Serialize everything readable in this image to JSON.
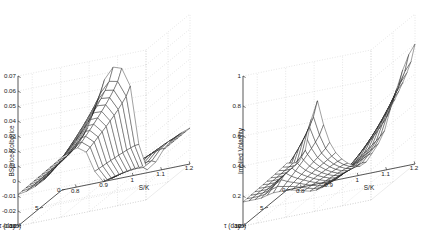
{
  "figure": {
    "background_color": "#ffffff",
    "mesh_color": "#111111",
    "grid_color": "#b9b9b9",
    "axis_color": "#3a3a3a",
    "panel_count": 2
  },
  "chart_data": [
    {
      "type": "surface",
      "panel": "left",
      "title": "",
      "zlabel": "BSprice-Kolbprice",
      "xlabel": "S/K",
      "ylabel": "τ (days)",
      "xticks": [
        "0.8",
        "0.9",
        "1",
        "1.1",
        "1.2"
      ],
      "xtickvals": [
        0.8,
        0.9,
        1,
        1.1,
        1.2
      ],
      "yticks": [
        "0",
        "5",
        "10"
      ],
      "ytickvals": [
        0,
        5,
        10
      ],
      "zticks": [
        "-0.03",
        "-0.02",
        "-0.01",
        "0",
        "0.01",
        "0.02",
        "0.03",
        "0.04",
        "0.05",
        "0.06",
        "0.07"
      ],
      "ztickvals": [
        -0.03,
        -0.02,
        -0.01,
        0,
        0.01,
        0.02,
        0.03,
        0.04,
        0.05,
        0.06,
        0.07
      ],
      "xlim": [
        0.75,
        1.2
      ],
      "ylim": [
        0,
        10
      ],
      "zlim": [
        -0.03,
        0.07
      ],
      "grid": true,
      "mesh_nx": 16,
      "mesh_ny": 12,
      "surface_model": "antisym_peak_trough",
      "description": "Black-Scholes minus Kolb price difference surface: broad positive ridge rising to about 0.045 near S/K=0.95 for short maturities, a sharp drop crossing zero near S/K=1.0, a negative trough reaching about -0.028 near S/K=1.03, then recovering toward -0.005 at S/K=1.2.",
      "x_values": [
        0.75,
        0.78,
        0.81,
        0.84,
        0.87,
        0.9,
        0.93,
        0.96,
        0.99,
        1.02,
        1.05,
        1.08,
        1.11,
        1.14,
        1.17,
        1.2
      ],
      "y_values": [
        0,
        0.91,
        1.82,
        2.73,
        3.64,
        4.55,
        5.45,
        6.36,
        7.27,
        8.18,
        9.09,
        10
      ],
      "z_profile_tau0": [
        -0.008,
        -0.006,
        -0.001,
        0.008,
        0.022,
        0.038,
        0.045,
        0.043,
        0.03,
        -0.01,
        -0.028,
        -0.024,
        -0.016,
        -0.011,
        -0.008,
        -0.006
      ],
      "z_profile_tau10": [
        -0.009,
        -0.008,
        -0.006,
        -0.003,
        0.002,
        0.008,
        0.013,
        0.014,
        0.01,
        -0.004,
        -0.012,
        -0.011,
        -0.009,
        -0.008,
        -0.007,
        -0.006
      ]
    },
    {
      "type": "surface",
      "panel": "right",
      "title": "",
      "zlabel": "Implied Volatility",
      "xlabel": "S/K",
      "ylabel": "τ (days)",
      "xticks": [
        "0.8",
        "0.9",
        "1",
        "1.1",
        "1.2"
      ],
      "xtickvals": [
        0.8,
        0.9,
        1,
        1.1,
        1.2
      ],
      "yticks": [
        "0",
        "5",
        "10"
      ],
      "ytickvals": [
        0,
        5,
        10
      ],
      "zticks": [
        "0",
        "0.2",
        "0.4",
        "0.6",
        "0.8",
        "1"
      ],
      "ztickvals": [
        0,
        0.2,
        0.4,
        0.6,
        0.8,
        1
      ],
      "xlim": [
        0.75,
        1.2
      ],
      "ylim": [
        0,
        10
      ],
      "zlim": [
        0,
        1
      ],
      "grid": true,
      "mesh_nx": 22,
      "mesh_ny": 12,
      "surface_model": "volatility_smile",
      "description": "Implied volatility smile surface: deep-in-the-money wing rises steeply to about 0.6 at S/K=0.85 for short maturity, flat valley near 0.1 around S/K=1.0, and the out-of-the-money wing climbing to about 0.8 at S/K=1.2.",
      "x_values": [
        0.75,
        0.77,
        0.79,
        0.81,
        0.83,
        0.85,
        0.87,
        0.89,
        0.91,
        0.93,
        0.95,
        0.97,
        0.99,
        1.01,
        1.03,
        1.06,
        1.09,
        1.12,
        1.14,
        1.16,
        1.18,
        1.2
      ],
      "y_values": [
        0,
        0.91,
        1.82,
        2.73,
        3.64,
        4.55,
        5.45,
        6.36,
        7.27,
        8.18,
        9.09,
        10
      ],
      "z_profile_tau0": [
        0.18,
        0.17,
        0.17,
        0.22,
        0.4,
        0.6,
        0.44,
        0.3,
        0.22,
        0.16,
        0.12,
        0.09,
        0.07,
        0.06,
        0.08,
        0.15,
        0.26,
        0.42,
        0.54,
        0.65,
        0.74,
        0.8
      ],
      "z_profile_tau10": [
        0.16,
        0.16,
        0.16,
        0.16,
        0.17,
        0.18,
        0.18,
        0.18,
        0.18,
        0.17,
        0.16,
        0.15,
        0.14,
        0.14,
        0.15,
        0.17,
        0.2,
        0.24,
        0.27,
        0.3,
        0.34,
        0.38
      ]
    }
  ]
}
